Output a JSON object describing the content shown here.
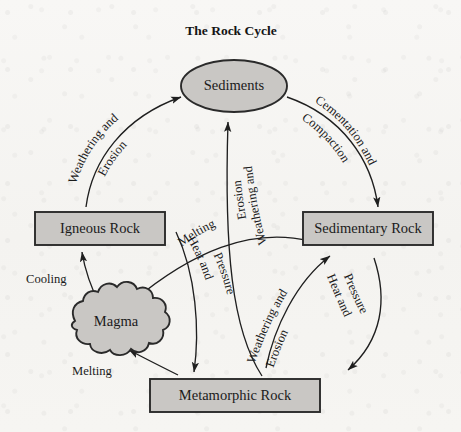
{
  "title": "The Rock Cycle",
  "colors": {
    "shape_fill": "#c9c7c4",
    "shape_stroke": "#2a2a2a",
    "arrow": "#1f1f1f",
    "text": "#1b1b1b",
    "background": "#f7f6f4"
  },
  "nodes": {
    "sediments": "Sediments",
    "igneous": "Igneous Rock",
    "sedimentary": "Sedimentary Rock",
    "metamorphic": "Metamorphic Rock",
    "magma": "Magma"
  },
  "edges": {
    "igneous_to_sediments": "Weathering and Erosion",
    "igneous_to_sediments_line1": "Weathering and",
    "igneous_to_sediments_line2": "Erosion",
    "sediments_to_sedimentary_line1": "Cementation and",
    "sediments_to_sedimentary_line2": "Compaction",
    "metamorphic_to_sediments_line1": "Weathering and",
    "metamorphic_to_sediments_line2": "Erosion",
    "metamorphic_to_sedimentary_line1": "Weathering and",
    "metamorphic_to_sedimentary_line2": "Erosion",
    "sedimentary_to_magma": "Melting",
    "sedimentary_to_metamorphic_line1": "Heat and",
    "sedimentary_to_metamorphic_line2": "Pressure",
    "igneous_to_metamorphic_line1": "Heat and",
    "igneous_to_metamorphic_line2": "Pressure",
    "magma_to_igneous": "Cooling",
    "metamorphic_to_magma": "Melting"
  }
}
